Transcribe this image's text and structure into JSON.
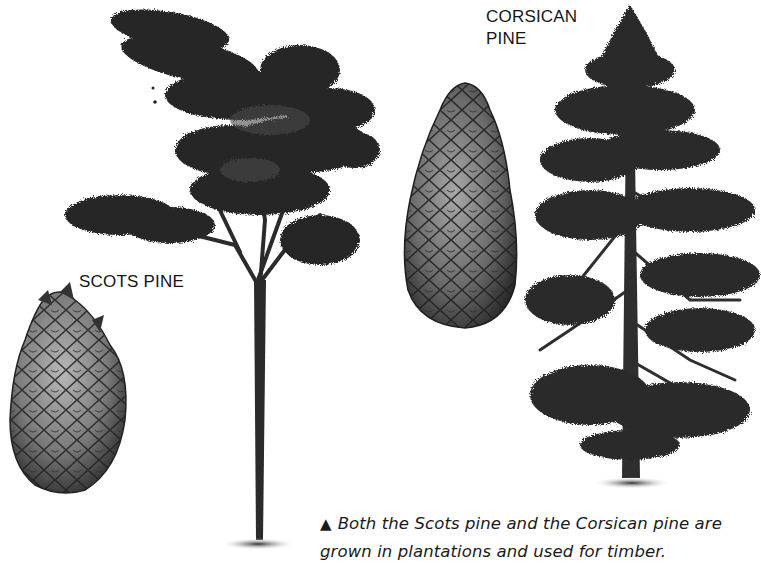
{
  "labels": {
    "scots_pine": "SCOTS PINE",
    "corsican_pine_line1": "CORSICAN",
    "corsican_pine_line2": "PINE"
  },
  "caption": {
    "marker": "▲",
    "line1": "Both the Scots pine and the Corsican pine are",
    "line2": "grown in plantations and used for timber."
  },
  "illustrations": [
    {
      "name": "scots-pine-tree",
      "description": "Scots pine tree with broad flat-topped crown and tall bare trunk"
    },
    {
      "name": "scots-pine-cone",
      "description": "Scots pine cone, short and ovoid"
    },
    {
      "name": "corsican-pine-cone",
      "description": "Corsican pine cone, elongated"
    },
    {
      "name": "corsican-pine-tree",
      "description": "Corsican pine tree, conical with tiered branches"
    }
  ],
  "colors": {
    "background": "#ffffff",
    "ink": "#1a1a1a",
    "foliage": "#2a2a2a",
    "cone_light": "#9a9a9a"
  }
}
